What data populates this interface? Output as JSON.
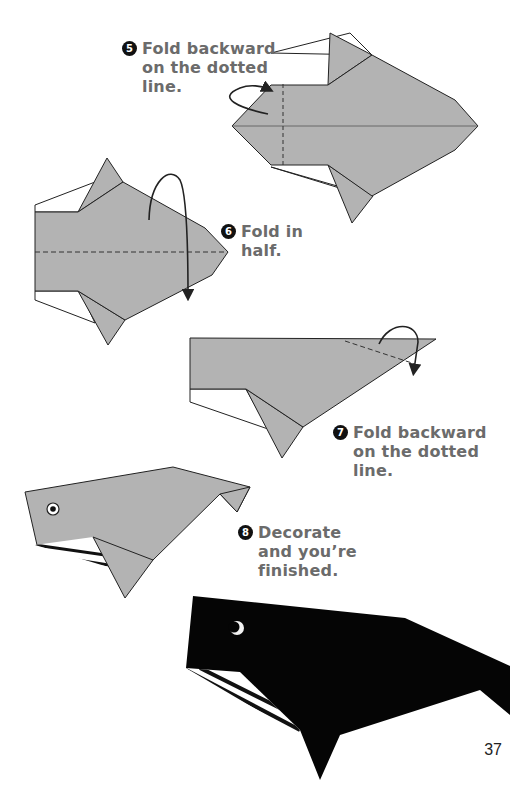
{
  "page": {
    "number": "37",
    "colors": {
      "paper_gray": "#b3b3b3",
      "outline": "#333333",
      "text_gray": "#6b6b6b",
      "finished_black": "#050505"
    }
  },
  "steps": [
    {
      "number": "5",
      "lines": [
        "Fold backward",
        "on the dotted",
        "line."
      ]
    },
    {
      "number": "6",
      "lines": [
        "Fold in",
        "half."
      ]
    },
    {
      "number": "7",
      "lines": [
        "Fold backward",
        "on the dotted",
        "line."
      ]
    },
    {
      "number": "8",
      "lines": [
        "Decorate",
        "and you’re",
        "finished."
      ]
    }
  ],
  "illustrations": [
    {
      "name": "step-5-diagram",
      "icon": "fold-backward-arrow-icon"
    },
    {
      "name": "step-6-diagram",
      "icon": "fold-in-half-arrow-icon"
    },
    {
      "name": "step-7-diagram",
      "icon": "fold-backward-arrow-icon"
    },
    {
      "name": "step-8-diagram",
      "icon": "whale-eye-icon"
    },
    {
      "name": "finished-whale-photo"
    }
  ]
}
